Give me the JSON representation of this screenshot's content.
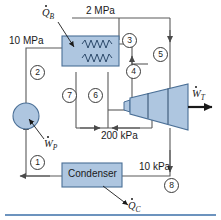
{
  "figure": {
    "type": "schematic",
    "colors": {
      "component_fill": "#aec6e0",
      "component_stroke": "#4a6f96",
      "line": "#5a5a5a",
      "text": "#1a1a1a",
      "rule": "#3b6fa8"
    }
  },
  "components": {
    "boiler": {
      "name": "boiler",
      "heat_label": "Q",
      "heat_sub": "B"
    },
    "turbine": {
      "name": "turbine",
      "work_label": "W",
      "work_sub": "T"
    },
    "condenser": {
      "name": "condenser",
      "label": "Condenser",
      "heat_label": "Q",
      "heat_sub": "C"
    },
    "pump": {
      "name": "pump",
      "work_label": "W",
      "work_sub": "P"
    }
  },
  "pressures": [
    {
      "id": "p-10mpa",
      "text": "10 MPa"
    },
    {
      "id": "p-2mpa",
      "text": "2 MPa"
    },
    {
      "id": "p-200kpa",
      "text": "200 kPa"
    },
    {
      "id": "p-10kpa",
      "text": "10 kPa"
    }
  ],
  "state_points": [
    {
      "id": "state-1",
      "text": "1"
    },
    {
      "id": "state-2",
      "text": "2"
    },
    {
      "id": "state-3",
      "text": "3"
    },
    {
      "id": "state-4",
      "text": "4"
    },
    {
      "id": "state-5",
      "text": "5"
    },
    {
      "id": "state-6",
      "text": "6"
    },
    {
      "id": "state-7",
      "text": "7"
    },
    {
      "id": "state-8",
      "text": "8"
    }
  ]
}
